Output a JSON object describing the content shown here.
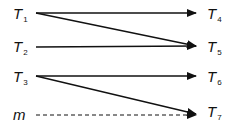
{
  "diagram": {
    "type": "mapping-arrows",
    "left_nodes": [
      {
        "base": "T",
        "sub": "1"
      },
      {
        "base": "T",
        "sub": "2"
      },
      {
        "base": "T",
        "sub": "3"
      },
      {
        "base": "m",
        "sub": ""
      }
    ],
    "right_nodes": [
      {
        "base": "T",
        "sub": "4"
      },
      {
        "base": "T",
        "sub": "5"
      },
      {
        "base": "T",
        "sub": "6"
      },
      {
        "base": "T",
        "sub": "7"
      }
    ],
    "edges": [
      {
        "from": "T1",
        "to": "T4",
        "style": "solid"
      },
      {
        "from": "T1",
        "to": "T5",
        "style": "solid"
      },
      {
        "from": "T2",
        "to": "T5",
        "style": "solid"
      },
      {
        "from": "T3",
        "to": "T6",
        "style": "solid"
      },
      {
        "from": "T3",
        "to": "T7",
        "style": "solid"
      },
      {
        "from": "m",
        "to": "T7",
        "style": "dashed"
      }
    ],
    "colors": {
      "line": "#111111",
      "text": "#111111"
    }
  }
}
